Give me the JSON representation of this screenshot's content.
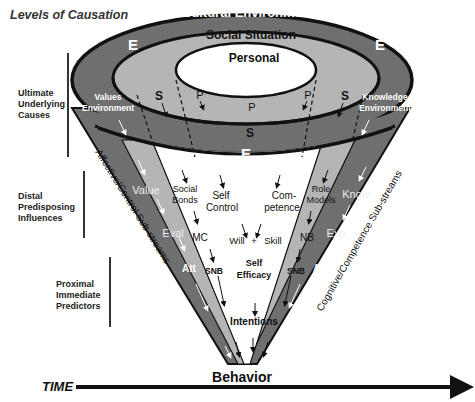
{
  "title": "Levels of Causation",
  "levels": [
    {
      "label": "Levels of Causation"
    },
    {
      "label": "Ultimate Underlying Causes"
    },
    {
      "label": "Distal Predisposing Influences"
    },
    {
      "label": "Proximal Immediate Predictors"
    }
  ],
  "rings": {
    "cultural": "Cultural Environment",
    "social": "Social Situation",
    "personal": "Personal",
    "e": "E",
    "s": "S",
    "p": "P"
  },
  "environments": {
    "values_line1": "Values",
    "values_line2": "Environment",
    "knowledge_line1": "Knowledge",
    "knowledge_line2": "Environment"
  },
  "streams": {
    "left": "Affective/Control Sub-streams",
    "right": "Cognitive/Competence Sub-streams"
  },
  "nodes": {
    "value": "Value",
    "eval": "Eval",
    "att": "Att",
    "social_bonds_1": "Social",
    "social_bonds_2": "Bonds",
    "mc": "MC",
    "snb": "SNB",
    "self_control_1": "Self",
    "self_control_2": "Control",
    "competence_1": "Com-",
    "competence_2": "petence",
    "will": "Will",
    "plus": "+",
    "skill": "Skill",
    "self_efficacy_1": "Self",
    "self_efficacy_2": "Efficacy",
    "intentions": "Intentions",
    "role_models_1": "Role",
    "role_models_2": "Models",
    "nb": "NB",
    "know": "Know",
    "exp": "Exp"
  },
  "outcome": "Behavior",
  "time_label": "TIME",
  "colors": {
    "outer_band": "#6f6f6f",
    "middle_band": "#b5b5b5",
    "inner": "#ffffff",
    "outline": "#111111"
  }
}
